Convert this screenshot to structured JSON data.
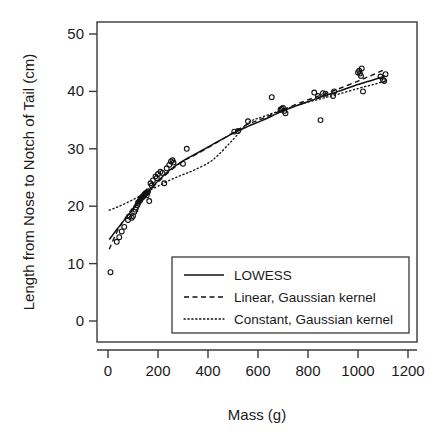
{
  "chart_data": {
    "type": "scatter",
    "title": "",
    "xlabel": "Mass (g)",
    "ylabel": "Length from Nose to Notch of Tail (cm)",
    "xlim": [
      -60,
      1290
    ],
    "ylim": [
      -2,
      53
    ],
    "xticks": [
      0,
      200,
      400,
      600,
      800,
      1000,
      1200
    ],
    "xtick_labels": [
      "0",
      "200",
      "400",
      "600",
      "800",
      "1000",
      "1200"
    ],
    "yticks": [
      0,
      10,
      20,
      30,
      40,
      50
    ],
    "ytick_labels": [
      "0",
      "10",
      "20",
      "30",
      "40",
      "50"
    ],
    "grid": false,
    "legend_position": "lower right",
    "marker": "open-circle",
    "points": [
      [
        10,
        8.5
      ],
      [
        35,
        13.8
      ],
      [
        45,
        14.6
      ],
      [
        55,
        15.6
      ],
      [
        65,
        16.4
      ],
      [
        80,
        17.6
      ],
      [
        85,
        18.2
      ],
      [
        95,
        18.0
      ],
      [
        100,
        18.3
      ],
      [
        105,
        19.0
      ],
      [
        110,
        19.4
      ],
      [
        112,
        19.8
      ],
      [
        118,
        20.2
      ],
      [
        120,
        20.6
      ],
      [
        124,
        20.8
      ],
      [
        128,
        21.0
      ],
      [
        130,
        21.2
      ],
      [
        132,
        21.4
      ],
      [
        135,
        21.5
      ],
      [
        138,
        21.6
      ],
      [
        140,
        21.7
      ],
      [
        142,
        21.8
      ],
      [
        145,
        22.0
      ],
      [
        148,
        22.1
      ],
      [
        150,
        22.2
      ],
      [
        152,
        22.3
      ],
      [
        155,
        21.9
      ],
      [
        158,
        22.4
      ],
      [
        160,
        22.6
      ],
      [
        165,
        20.9
      ],
      [
        170,
        24.0
      ],
      [
        175,
        23.6
      ],
      [
        180,
        24.5
      ],
      [
        190,
        25.2
      ],
      [
        195,
        24.9
      ],
      [
        200,
        25.6
      ],
      [
        210,
        26.0
      ],
      [
        218,
        25.8
      ],
      [
        225,
        24.0
      ],
      [
        235,
        26.6
      ],
      [
        245,
        27.2
      ],
      [
        252,
        27.8
      ],
      [
        258,
        28.0
      ],
      [
        262,
        27.6
      ],
      [
        300,
        27.4
      ],
      [
        315,
        30.0
      ],
      [
        505,
        33.0
      ],
      [
        520,
        33.1
      ],
      [
        560,
        34.8
      ],
      [
        655,
        39.0
      ],
      [
        690,
        36.8
      ],
      [
        695,
        37.0
      ],
      [
        700,
        37.1
      ],
      [
        705,
        36.6
      ],
      [
        710,
        36.2
      ],
      [
        825,
        39.8
      ],
      [
        840,
        39.2
      ],
      [
        850,
        35.0
      ],
      [
        860,
        39.7
      ],
      [
        870,
        39.6
      ],
      [
        900,
        39.2
      ],
      [
        905,
        40.0
      ],
      [
        1000,
        43.3
      ],
      [
        1005,
        43.6
      ],
      [
        1008,
        43.1
      ],
      [
        1012,
        42.7
      ],
      [
        1015,
        44.0
      ],
      [
        1020,
        40.0
      ],
      [
        1090,
        42.6
      ],
      [
        1100,
        42.0
      ],
      [
        1105,
        41.8
      ],
      [
        1110,
        43.0
      ]
    ],
    "series": [
      {
        "name": "LOWESS",
        "style": "solid",
        "x": [
          5,
          40,
          80,
          120,
          160,
          200,
          250,
          300,
          350,
          420,
          500,
          560,
          620,
          700,
          780,
          850,
          920,
          1000,
          1060,
          1110
        ],
        "y": [
          14.2,
          16.2,
          18.4,
          20.6,
          22.6,
          24.4,
          26.4,
          27.9,
          29.1,
          30.8,
          32.7,
          33.9,
          35.0,
          36.6,
          37.9,
          39.0,
          40.0,
          41.2,
          42.0,
          42.7
        ]
      },
      {
        "name": "Linear, Gaussian kernel",
        "style": "dashed",
        "x": [
          5,
          40,
          80,
          120,
          160,
          200,
          250,
          300,
          350,
          420,
          500,
          560,
          620,
          700,
          780,
          850,
          920,
          1000,
          1060,
          1110
        ],
        "y": [
          12.5,
          15.9,
          18.6,
          20.8,
          22.6,
          24.2,
          26.2,
          27.8,
          29.0,
          30.7,
          32.8,
          34.3,
          35.3,
          36.8,
          38.2,
          39.3,
          40.4,
          41.8,
          42.9,
          43.9
        ]
      },
      {
        "name": "Constant, Gaussian kernel",
        "style": "dotted",
        "x": [
          5,
          40,
          80,
          120,
          160,
          200,
          250,
          300,
          350,
          420,
          500,
          560,
          620,
          700,
          780,
          850,
          920,
          1000,
          1060,
          1110
        ],
        "y": [
          19.3,
          19.9,
          20.7,
          21.6,
          22.6,
          23.5,
          24.6,
          25.5,
          26.4,
          28.1,
          31.6,
          34.5,
          35.6,
          36.8,
          37.9,
          38.7,
          39.5,
          40.5,
          41.2,
          41.8
        ]
      }
    ]
  },
  "legend": {
    "entries": [
      {
        "label": "LOWESS",
        "style": "solid"
      },
      {
        "label": "Linear, Gaussian kernel",
        "style": "dashed"
      },
      {
        "label": "Constant, Gaussian kernel",
        "style": "dotted"
      }
    ]
  },
  "colors": {
    "ink": "#111111",
    "frame": "#3a3a3a",
    "background": "#ffffff"
  }
}
